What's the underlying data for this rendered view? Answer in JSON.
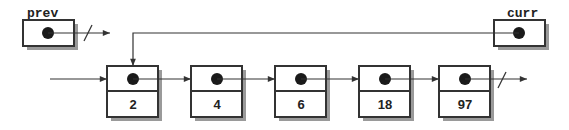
{
  "diagram": {
    "type": "linked-list",
    "pointers": [
      {
        "id": "prev",
        "label": "prev",
        "target": null
      },
      {
        "id": "curr",
        "label": "curr",
        "target": "node-0"
      }
    ],
    "nodes": [
      {
        "id": "node-0",
        "value": "2"
      },
      {
        "id": "node-1",
        "value": "4"
      },
      {
        "id": "node-2",
        "value": "6"
      },
      {
        "id": "node-3",
        "value": "18"
      },
      {
        "id": "node-4",
        "value": "97"
      }
    ],
    "tail_next": null,
    "colors": {
      "stroke": "#333333",
      "shadow": "#9a9a9a",
      "fill": "#ffffff",
      "dot": "#1a1a1a"
    }
  }
}
